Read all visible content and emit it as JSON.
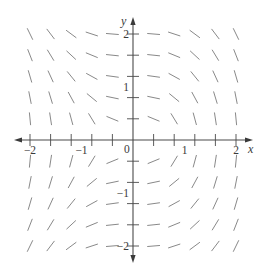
{
  "figure": {
    "type": "slope-field",
    "equation_inferred": "dy/dx = -x^2 / y",
    "x_axis": {
      "label": "x",
      "min": -2,
      "max": 2,
      "tick_step": 0.4,
      "tick_labels": [
        {
          "value": -2,
          "text": "−2"
        },
        {
          "value": -1,
          "text": "−1"
        },
        {
          "value": 1,
          "text": "1"
        },
        {
          "value": 2,
          "text": "2"
        }
      ]
    },
    "y_axis": {
      "label": "y",
      "min": -2,
      "max": 2,
      "tick_step": 0.4,
      "tick_labels": [
        {
          "value": 2,
          "text": "2"
        },
        {
          "value": 1,
          "text": "1"
        },
        {
          "value": -1,
          "text": "−1"
        },
        {
          "value": -2,
          "text": "−2"
        }
      ]
    },
    "origin_label": "0",
    "grid_x": [
      -2,
      -1.6,
      -1.2,
      -0.8,
      -0.4,
      0.4,
      0.8,
      1.2,
      1.6,
      2
    ],
    "grid_y": [
      -2,
      -1.6,
      -1.2,
      -0.8,
      -0.4,
      0.4,
      0.8,
      1.2,
      1.6,
      2
    ],
    "colors": {
      "segment": "#7a7a7a",
      "axis": "#4a4a4a",
      "text": "#3a3a3a",
      "background": "#ffffff"
    }
  },
  "layout": {
    "origin_px": [
      133,
      140
    ],
    "px_per_unit_x": 51.5,
    "px_per_unit_y": 53,
    "segment_length_px": 12,
    "x_axis_px_range": [
      14,
      253
    ],
    "y_axis_px_range": [
      17,
      263
    ]
  }
}
